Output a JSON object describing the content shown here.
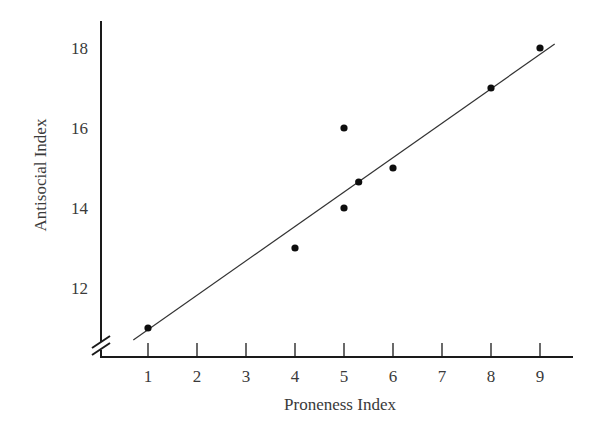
{
  "chart_data": {
    "type": "scatter",
    "title": "",
    "xlabel": "Proneness Index",
    "ylabel": "Antisocial Index",
    "x_ticks": [
      1,
      2,
      3,
      4,
      5,
      6,
      7,
      8,
      9
    ],
    "y_ticks": [
      12,
      14,
      16,
      18
    ],
    "xlim": [
      0,
      9.6
    ],
    "ylim": [
      10.3,
      18.7
    ],
    "y_axis_break": true,
    "grid": false,
    "legend": null,
    "series": [
      {
        "name": "observations",
        "points": [
          {
            "x": 1,
            "y": 11
          },
          {
            "x": 4,
            "y": 13
          },
          {
            "x": 5,
            "y": 14
          },
          {
            "x": 5,
            "y": 16
          },
          {
            "x": 5.3,
            "y": 14.65
          },
          {
            "x": 6,
            "y": 15
          },
          {
            "x": 8,
            "y": 17
          },
          {
            "x": 9,
            "y": 18
          }
        ]
      }
    ],
    "fit_line": {
      "type": "linear",
      "start": {
        "x": 0.7,
        "y": 10.7
      },
      "end": {
        "x": 9.3,
        "y": 18.1
      }
    }
  },
  "labels": {
    "x_title": "Proneness Index",
    "y_title": "Antisocial Index",
    "x_tick_labels": [
      "1",
      "2",
      "3",
      "4",
      "5",
      "6",
      "7",
      "8",
      "9"
    ],
    "y_tick_labels": [
      "12",
      "14",
      "16",
      "18"
    ]
  },
  "colors": {
    "axis": "#1a1a1a",
    "points": "#0d0d0d",
    "line": "#333333",
    "text": "#3a3a3a"
  }
}
